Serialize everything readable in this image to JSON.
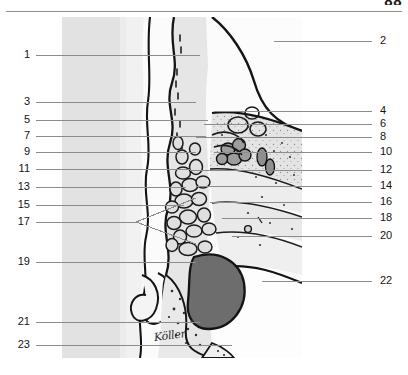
{
  "page": {
    "folio": "88",
    "rule": true,
    "background_color": "#ffffff"
  },
  "figure": {
    "name": "anatomical-cross-section",
    "type": "grayscale-histological-illustration",
    "frame": {
      "x": 62,
      "y": 17,
      "width": 240,
      "height": 341
    },
    "palette": {
      "paper": "#fbfbfb",
      "tint_light": "#e8e8e8",
      "tint_mid": "#d2d2d2",
      "tint_dark": "#b0b0b0",
      "cavity_dark": "#6d6d6d",
      "outline": "#1a1a1a",
      "leader": "#8c8c8c"
    },
    "signature": "Köller"
  },
  "labels": {
    "left": [
      {
        "number": "1",
        "y": 55,
        "line_x2": 200
      },
      {
        "number": "3",
        "y": 102,
        "line_x2": 196
      },
      {
        "number": "5",
        "y": 120,
        "line_x2": 208
      },
      {
        "number": "7",
        "y": 136,
        "line_x2": 206
      },
      {
        "number": "9",
        "y": 152,
        "line_x2": 196
      },
      {
        "number": "11",
        "y": 169,
        "line_x2": 190
      },
      {
        "number": "13",
        "y": 187,
        "line_x2": 186
      },
      {
        "number": "15",
        "y": 205,
        "line_x2": 184
      },
      {
        "number": "17",
        "y": 222,
        "line_x2": 136
      },
      {
        "number": "19",
        "y": 262,
        "line_x2": 196
      },
      {
        "number": "21",
        "y": 322,
        "line_x2": 200
      },
      {
        "number": "23",
        "y": 345,
        "line_x2": 232
      }
    ],
    "right": [
      {
        "number": "2",
        "y": 41,
        "line_x1": 274
      },
      {
        "number": "4",
        "y": 111,
        "line_x1": 214
      },
      {
        "number": "6",
        "y": 124,
        "line_x1": 204
      },
      {
        "number": "8",
        "y": 137,
        "line_x1": 196
      },
      {
        "number": "10",
        "y": 152,
        "line_x1": 214
      },
      {
        "number": "12",
        "y": 170,
        "line_x1": 190
      },
      {
        "number": "14",
        "y": 186,
        "line_x1": 196
      },
      {
        "number": "16",
        "y": 202,
        "line_x1": 210
      },
      {
        "number": "18",
        "y": 218,
        "line_x1": 222
      },
      {
        "number": "20",
        "y": 236,
        "line_x1": 232
      },
      {
        "number": "22",
        "y": 281,
        "line_x1": 262
      }
    ]
  }
}
